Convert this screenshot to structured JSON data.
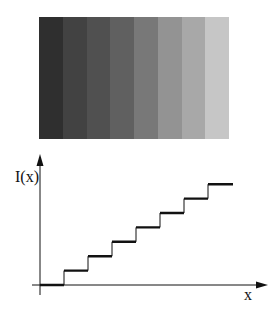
{
  "figure": {
    "top_panel": {
      "description": "Uniform-intensity gray bands of increasing brightness",
      "band_count": 8,
      "bands": [
        {
          "index": 1,
          "color": "#2f2f2f"
        },
        {
          "index": 2,
          "color": "#424242"
        },
        {
          "index": 3,
          "color": "#505050"
        },
        {
          "index": 4,
          "color": "#606060"
        },
        {
          "index": 5,
          "color": "#787878"
        },
        {
          "index": 6,
          "color": "#939393"
        },
        {
          "index": 7,
          "color": "#a8a8a8"
        },
        {
          "index": 8,
          "color": "#c6c6c6"
        }
      ]
    },
    "bottom_panel": {
      "ylabel": "I(x)",
      "xlabel": "x",
      "line_color": "#111111"
    }
  },
  "chart_data": {
    "type": "line",
    "title": "",
    "xlabel": "x",
    "ylabel": "I(x)",
    "step": true,
    "grid": false,
    "x": [
      0,
      1,
      2,
      3,
      4,
      5,
      6,
      7,
      8
    ],
    "series": [
      {
        "name": "I(x)",
        "values": [
          0,
          1,
          2,
          3,
          4,
          5,
          6,
          7,
          7
        ]
      }
    ],
    "levels": [
      0,
      1,
      2,
      3,
      4,
      5,
      6,
      7
    ],
    "xlim": [
      0,
      8.6
    ],
    "ylim": [
      0,
      9
    ]
  }
}
